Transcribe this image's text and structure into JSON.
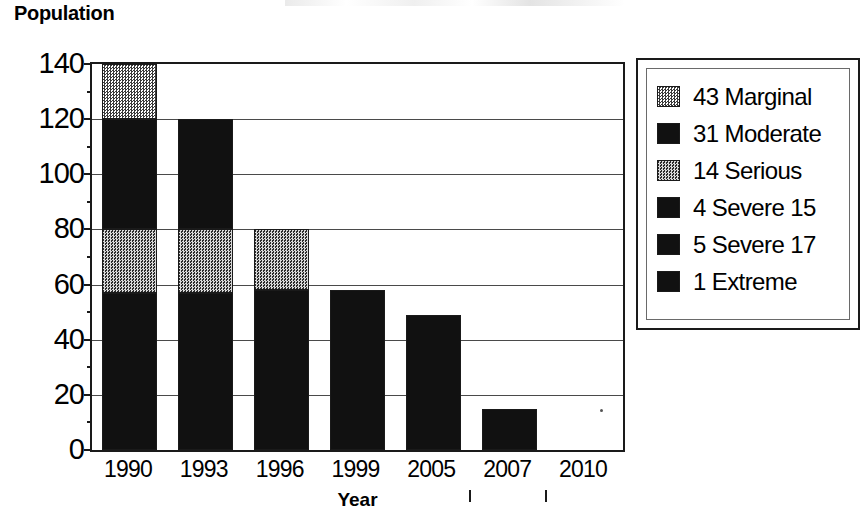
{
  "chart_data": {
    "type": "bar",
    "subtype": "stacked-vertical",
    "title": "",
    "xlabel": "Year",
    "ylabel": "Population",
    "ylim": [
      0,
      140
    ],
    "ytick_step": 20,
    "yminor_step": 10,
    "grid": true,
    "legend_position": "right",
    "categories": [
      "1990",
      "1993",
      "1996",
      "1999",
      "2005",
      "2007",
      "2010"
    ],
    "ytick_labels": [
      "140",
      "120",
      "100",
      "80",
      "60",
      "40",
      "20",
      "0"
    ],
    "series": [
      {
        "name": "43 Marginal",
        "color": "#a0a0a0",
        "fill": "light-gray-dither",
        "values": [
          20,
          0,
          0,
          0,
          0,
          0,
          0
        ]
      },
      {
        "name": "31 Moderate",
        "color": "#111111",
        "fill": "solid-black",
        "values": [
          40,
          40,
          0,
          0,
          0,
          0,
          0
        ]
      },
      {
        "name": "14 Serious",
        "color": "#555555",
        "fill": "mid-gray-dither",
        "values": [
          23,
          23,
          22,
          0,
          0,
          0,
          0
        ]
      },
      {
        "name": "4 Severe 15",
        "color": "#111111",
        "fill": "solid-black",
        "values": [
          57,
          57,
          58,
          58,
          49,
          15,
          0
        ]
      },
      {
        "name": "5 Severe 17",
        "color": "#111111",
        "fill": "solid-black",
        "values": [
          0,
          0,
          0,
          0,
          0,
          0,
          0
        ]
      },
      {
        "name": "1 Extreme",
        "color": "#111111",
        "fill": "solid-black",
        "values": [
          0,
          0,
          0,
          0,
          0,
          0,
          0
        ]
      }
    ],
    "totals": [
      140,
      120,
      80,
      58,
      49,
      15,
      0
    ],
    "bars": [
      {
        "category": "1990",
        "total": 140,
        "segments": [
          {
            "series": "4 Severe 15",
            "from": 0,
            "to": 57,
            "fill": "solid-black"
          },
          {
            "series": "14 Serious",
            "from": 57,
            "to": 80,
            "fill": "mid-gray-dither"
          },
          {
            "series": "31 Moderate",
            "from": 80,
            "to": 120,
            "fill": "solid-black"
          },
          {
            "series": "43 Marginal",
            "from": 120,
            "to": 140,
            "fill": "light-gray-dither"
          }
        ]
      },
      {
        "category": "1993",
        "total": 120,
        "segments": [
          {
            "series": "4 Severe 15",
            "from": 0,
            "to": 57,
            "fill": "solid-black"
          },
          {
            "series": "14 Serious",
            "from": 57,
            "to": 80,
            "fill": "mid-gray-dither"
          },
          {
            "series": "31 Moderate",
            "from": 80,
            "to": 120,
            "fill": "solid-black"
          }
        ]
      },
      {
        "category": "1996",
        "total": 80,
        "segments": [
          {
            "series": "4 Severe 15",
            "from": 0,
            "to": 58,
            "fill": "solid-black"
          },
          {
            "series": "14 Serious",
            "from": 58,
            "to": 80,
            "fill": "mid-gray-dither"
          }
        ]
      },
      {
        "category": "1999",
        "total": 58,
        "segments": [
          {
            "series": "4 Severe 15",
            "from": 0,
            "to": 58,
            "fill": "solid-black"
          }
        ]
      },
      {
        "category": "2005",
        "total": 49,
        "segments": [
          {
            "series": "4 Severe 15",
            "from": 0,
            "to": 49,
            "fill": "solid-black"
          }
        ]
      },
      {
        "category": "2007",
        "total": 15,
        "segments": [
          {
            "series": "4 Severe 15",
            "from": 0,
            "to": 15,
            "fill": "solid-black"
          }
        ]
      },
      {
        "category": "2010",
        "total": 0,
        "segments": []
      }
    ]
  },
  "legend": {
    "items": [
      {
        "label": "43 Marginal"
      },
      {
        "label": "31 Moderate"
      },
      {
        "label": "14 Serious"
      },
      {
        "label": "4 Severe 15"
      },
      {
        "label": "5 Severe 17"
      },
      {
        "label": "1 Extreme"
      }
    ]
  },
  "axes": {
    "y_title": "Population",
    "x_title": "Year"
  }
}
